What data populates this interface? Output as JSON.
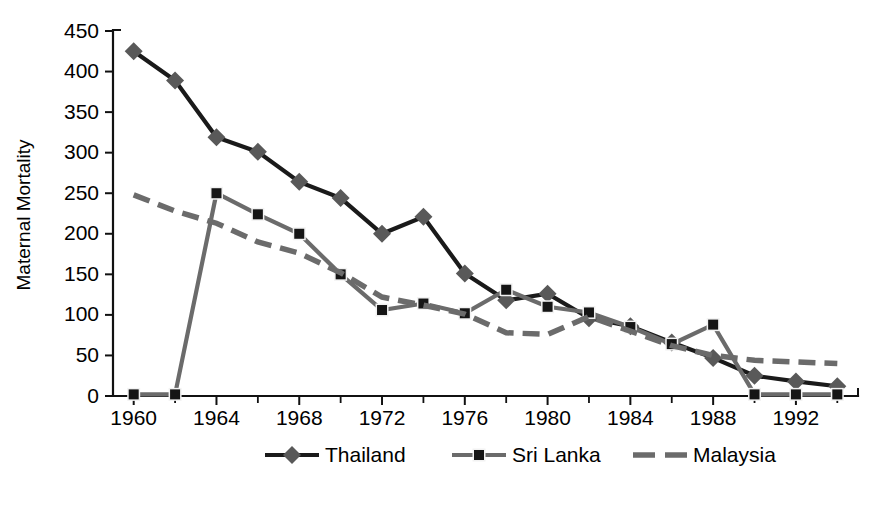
{
  "chart_data": {
    "type": "line",
    "title": "",
    "xlabel": "",
    "ylabel": "Maternal Mortality",
    "xlim": [
      1959,
      1995
    ],
    "ylim": [
      0,
      450
    ],
    "xticks": [
      1960,
      1964,
      1968,
      1972,
      1976,
      1980,
      1984,
      1988,
      1992
    ],
    "xticks_minor": [
      1962,
      1966,
      1970,
      1974,
      1978,
      1982,
      1986,
      1990,
      1994
    ],
    "yticks": [
      0,
      50,
      100,
      150,
      200,
      250,
      300,
      350,
      400,
      450
    ],
    "grid": false,
    "legend_position": "bottom",
    "x": [
      1960,
      1962,
      1964,
      1966,
      1968,
      1970,
      1972,
      1974,
      1976,
      1978,
      1980,
      1982,
      1984,
      1986,
      1988,
      1990,
      1992,
      1994
    ],
    "series": [
      {
        "name": "Thailand",
        "marker": "diamond",
        "dash": "solid",
        "color": "#1a1a1a",
        "marker_color": "#595959",
        "values": [
          425,
          389,
          319,
          301,
          264,
          244,
          200,
          221,
          151,
          118,
          126,
          96,
          86,
          66,
          47,
          25,
          18,
          12
        ]
      },
      {
        "name": "Sri Lanka",
        "marker": "square",
        "dash": "solid",
        "color": "#6b6b6b",
        "marker_color": "#151515",
        "values": [
          2,
          2,
          250,
          224,
          200,
          150,
          106,
          114,
          102,
          131,
          110,
          103,
          85,
          64,
          88,
          2,
          2,
          2
        ]
      },
      {
        "name": "Malaysia",
        "marker": "none",
        "dash": "dashed",
        "color": "#6b6b6b",
        "marker_color": "#6b6b6b",
        "values": [
          248,
          228,
          213,
          190,
          176,
          152,
          122,
          112,
          101,
          78,
          76,
          98,
          80,
          62,
          50,
          44,
          42,
          40
        ]
      }
    ]
  },
  "legend": {
    "items": [
      {
        "label": "Thailand",
        "marker": "diamond"
      },
      {
        "label": "Sri Lanka",
        "marker": "square"
      },
      {
        "label": "Malaysia",
        "marker": "none"
      }
    ]
  },
  "colors": {
    "thailand_line": "#1a1a1a",
    "thailand_marker": "#595959",
    "srilanka_line": "#6b6b6b",
    "srilanka_marker": "#151515",
    "malaysia_line": "#6b6b6b",
    "axis": "#111111",
    "background": "#ffffff"
  }
}
